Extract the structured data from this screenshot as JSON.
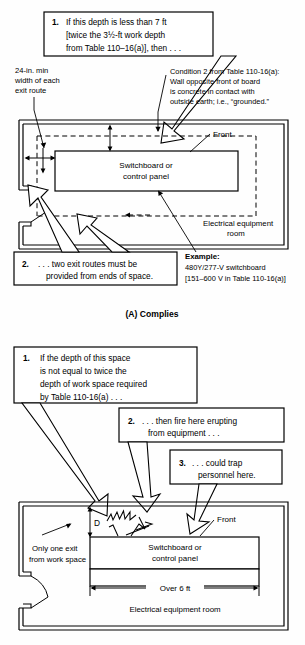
{
  "figure": {
    "title_a": "(A) Complies",
    "panel_a": {
      "callout_1": {
        "number": "1.",
        "lines": [
          "If this depth is less than 7 ft",
          "[twice the 3½-ft work depth",
          "from Table 110–16(a)], then . . ."
        ]
      },
      "callout_2": {
        "number": "2.",
        "lines": [
          ". . . two exit routes must be",
          "provided from ends of space."
        ]
      },
      "note_left": [
        "24-in. min",
        "width of each",
        "exit route"
      ],
      "note_condition": [
        "Condition 2 from Table 110-16(a):",
        "Wall opposite front of board",
        "is concrete in contact with",
        "outside earth; i.e., “grounded.”"
      ],
      "example": {
        "heading": "Example:",
        "lines": [
          "480Y/277-V switchboard",
          "[151–600 V in Table 110-16(a)]"
        ]
      },
      "label_front": "Front",
      "label_board": [
        "Switchboard or",
        "control panel"
      ],
      "label_room": [
        "Electrical equipment",
        "room"
      ]
    },
    "panel_b": {
      "callout_1": {
        "number": "1.",
        "lines": [
          "If the depth of this space",
          "is not equal to twice the",
          "depth of work space required",
          "by Table 110-16(a) . . ."
        ]
      },
      "callout_2": {
        "number": "2.",
        "lines": [
          ". . . then fire here erupting",
          "from equipment . . ."
        ]
      },
      "callout_3": {
        "number": "3.",
        "lines": [
          ". . . could trap",
          "personnel here."
        ]
      },
      "label_d": "D",
      "label_front": "Front",
      "label_board": [
        "Switchboard or",
        "control panel"
      ],
      "label_only_exit": [
        "Only one exit",
        "from work space"
      ],
      "label_over6ft": "Over 6 ft",
      "label_room": "Electrical equipment room"
    },
    "colors": {
      "line": "#000000",
      "background": "#fefefe"
    }
  }
}
